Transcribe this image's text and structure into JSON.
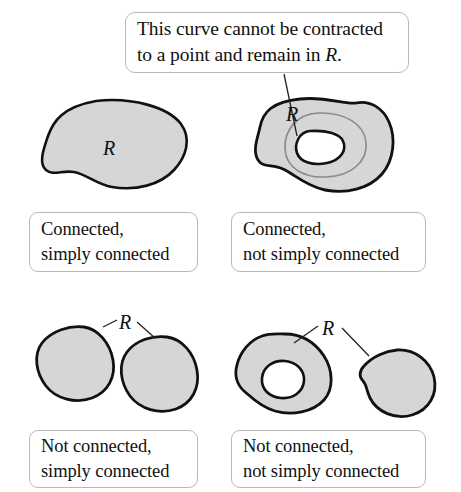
{
  "figure": {
    "background_color": "#ffffff",
    "region_fill_color": "#d6d6d6",
    "region_stroke_color": "#111111",
    "curve_color": "#8a8a8a",
    "hole_fill_color": "#ffffff",
    "box_border_color": "#b9b9bd",
    "leader_line_color": "#222222"
  },
  "callout": {
    "line1": "This curve cannot be contracted",
    "line2_before": "to a point and remain in ",
    "line2_italic": "R",
    "line2_after": "."
  },
  "labels": {
    "region_top_left": "R",
    "region_top_right": "R",
    "region_bottom_left": "R",
    "region_bottom_right": "R"
  },
  "captions": [
    {
      "id": "top-left",
      "line1": "Connected,",
      "line2": "simply connected"
    },
    {
      "id": "top-right",
      "line1": "Connected,",
      "line2": "not simply connected"
    },
    {
      "id": "bottom-left",
      "line1": "Not connected,",
      "line2": "simply connected"
    },
    {
      "id": "bottom-right",
      "line1": "Not connected,",
      "line2": "not simply connected"
    }
  ]
}
